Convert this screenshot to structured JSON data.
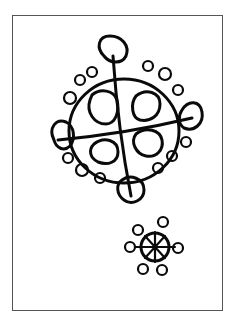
{
  "figure": {
    "ink_color": "#0a0a0a",
    "background_color": "#ffffff",
    "frame_color": "#555555",
    "large_motif": {
      "shape": "circle divided by cross into four quadrants, each containing a loop, ringed by petals",
      "inner_loops": 4,
      "large_petals": 4
    },
    "small_motif": {
      "shape": "small circle with radiating spokes ending in loops",
      "spokes": 6
    }
  }
}
